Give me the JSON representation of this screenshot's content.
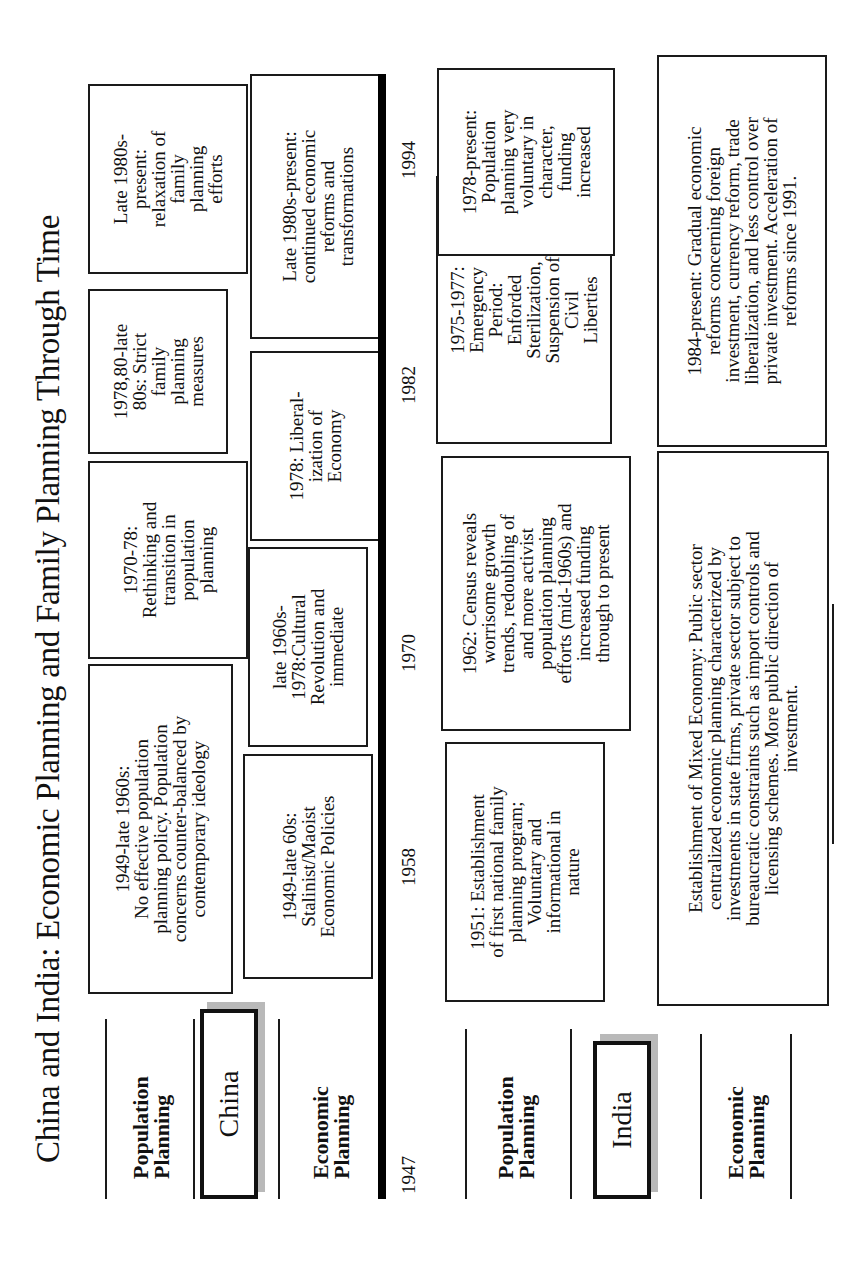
{
  "title": "China and India: Economic Planning and Family Planning Through Time",
  "china": {
    "label": "China",
    "population_label": "Population\nPlanning",
    "economic_label": "Economic\nPlanning",
    "population": [
      "1949-late 1960s:\nNo effective population\nplanning policy.  Population\nconcerns counter-balanced by\ncontemporary ideology",
      "1970-78:\nRethinking and\ntransition in\npopulation\nplanning",
      "1978,80-late\n80s: Strict\nfamily\nplanning\nmeasures",
      "Late 1980s-\npresent:\nrelaxation of\nfamily\nplanning\nefforts"
    ],
    "economic": [
      "1949-late 60s:\nStalinist/Maoist\nEconomic Policies",
      "late 1960s-\n1978:Cultural\nRevolution and\nimmediate",
      "1978: Liberal-\nization of\nEconomy",
      "Late 1980s-present:\ncontinued economic\nreforms and\ntransformations"
    ]
  },
  "years": [
    "1947",
    "1958",
    "1970",
    "1982",
    "1994"
  ],
  "india": {
    "label": "India",
    "population_label": "Population\nPlanning",
    "economic_label": "Economic\nPlanning",
    "population": [
      "1951: Establishment\nof first national family\nplanning program;\nVoluntary and\ninformational in\nnature",
      "1962: Census reveals\nworrisome growth\ntrends, redoubling of\nand more activist\npopulation planning\nefforts (mid-1960s) and\nincreased funding\nthrough to present",
      "1975-1977:\nEmergency\nPeriod:\nEnforded\nSterilization,\nSuspension of\nCivil\nLiberties",
      "1978-present:\nPopulation\nplanning very\nvoluntary in\ncharacter,\nfunding\nincreased"
    ],
    "economic": [
      "Establishment of Mixed Economy: Public sector\ncentralized economic planning characterized by\ninvestments in state firms, private sector subject to\nbureaucratic constraints such as import controls and\nlicensing schemes. More public direction of\ninvestment.",
      "1984-present: Gradual economic\nreforms  concerning foreign\ninvestment, currency reform,  trade\nliberalization,  and less control over\nprivate investment. Acceleration of\nreforms since 1991."
    ]
  }
}
